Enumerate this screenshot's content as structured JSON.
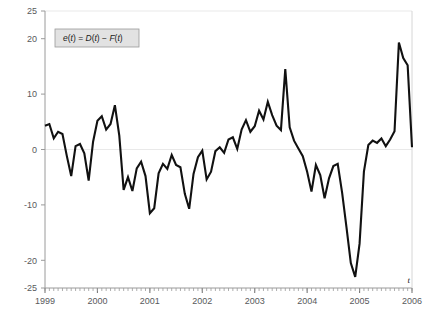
{
  "figure": {
    "background_color": "#ffffff",
    "line_color": "#111111",
    "axis_color": "#9a9a9a",
    "grid_color": "#e6e6e6",
    "legend_fill": "#e2e2e2",
    "legend_border": "#9a9a9a",
    "legend_label_prefix": "e",
    "legend_label_full": "e(t) = D(t) − F(t)",
    "xaxis_symbol": "t"
  },
  "chart_data": {
    "type": "line",
    "title": "",
    "subtitle": "",
    "xlabel": "t",
    "ylabel": "",
    "grid": true,
    "legend_position": "upper-left",
    "legend_entries": [
      "e(t) = D(t) − F(t)"
    ],
    "annotations": [
      "e(t) = D(t) − F(t)"
    ],
    "xlim": [
      1999.0,
      2006.0
    ],
    "ylim": [
      -25,
      25
    ],
    "yticks": [
      25,
      20,
      10,
      0,
      -10,
      -20,
      -25
    ],
    "ytick_labels": [
      "25",
      "20",
      "10",
      "0",
      "-10",
      "-20",
      "-25"
    ],
    "xticks": [
      1999,
      2000,
      2001,
      2002,
      2003,
      2004,
      2005,
      2006
    ],
    "xtick_labels": [
      "1999",
      "2000",
      "2001",
      "2002",
      "2003",
      "2004",
      "2005",
      "2006"
    ],
    "minor_xticks_per_year": 12,
    "series": [
      {
        "name": "e(t) = D(t) − F(t)",
        "color": "#111111",
        "x": [
          1999.0,
          1999.083,
          1999.167,
          1999.25,
          1999.333,
          1999.417,
          1999.5,
          1999.583,
          1999.667,
          1999.75,
          1999.833,
          1999.917,
          2000.0,
          2000.083,
          2000.167,
          2000.25,
          2000.333,
          2000.417,
          2000.5,
          2000.583,
          2000.667,
          2000.75,
          2000.833,
          2000.917,
          2001.0,
          2001.083,
          2001.167,
          2001.25,
          2001.333,
          2001.417,
          2001.5,
          2001.583,
          2001.667,
          2001.75,
          2001.833,
          2001.917,
          2002.0,
          2002.083,
          2002.167,
          2002.25,
          2002.333,
          2002.417,
          2002.5,
          2002.583,
          2002.667,
          2002.75,
          2002.833,
          2002.917,
          2003.0,
          2003.083,
          2003.167,
          2003.25,
          2003.333,
          2003.417,
          2003.5,
          2003.583,
          2003.667,
          2003.75,
          2003.833,
          2003.917,
          2004.0,
          2004.083,
          2004.167,
          2004.25,
          2004.333,
          2004.417,
          2004.5,
          2004.583,
          2004.667,
          2004.75,
          2004.833,
          2004.917,
          2005.0,
          2005.083,
          2005.167,
          2005.25,
          2005.333,
          2005.417,
          2005.5,
          2005.583,
          2005.667,
          2005.75,
          2005.833,
          2005.917,
          2006.0
        ],
        "values": [
          4.3,
          4.6,
          2.0,
          3.2,
          2.8,
          -1.2,
          -4.8,
          0.6,
          1.0,
          -0.7,
          -5.6,
          1.4,
          5.2,
          6.0,
          3.6,
          4.6,
          8.0,
          2.5,
          -7.3,
          -5.0,
          -7.5,
          -3.4,
          -2.2,
          -4.8,
          -11.5,
          -10.6,
          -4.3,
          -2.6,
          -3.5,
          -1.0,
          -2.8,
          -3.2,
          -8.0,
          -10.7,
          -4.4,
          -1.4,
          -0.2,
          -5.4,
          -4.0,
          -0.3,
          0.4,
          -0.6,
          1.8,
          2.2,
          0.1,
          3.6,
          5.3,
          3.2,
          4.2,
          7.0,
          5.4,
          8.6,
          6.2,
          4.3,
          3.5,
          14.5,
          4.0,
          1.6,
          0.2,
          -1.2,
          -4.0,
          -7.6,
          -2.8,
          -4.6,
          -8.8,
          -5.2,
          -3.0,
          -2.6,
          -7.8,
          -14.0,
          -20.5,
          -23.0,
          -17.0,
          -4.0,
          0.8,
          1.6,
          1.2,
          2.0,
          0.6,
          1.8,
          3.3,
          19.3,
          16.5,
          15.2,
          0.4
        ]
      }
    ]
  }
}
